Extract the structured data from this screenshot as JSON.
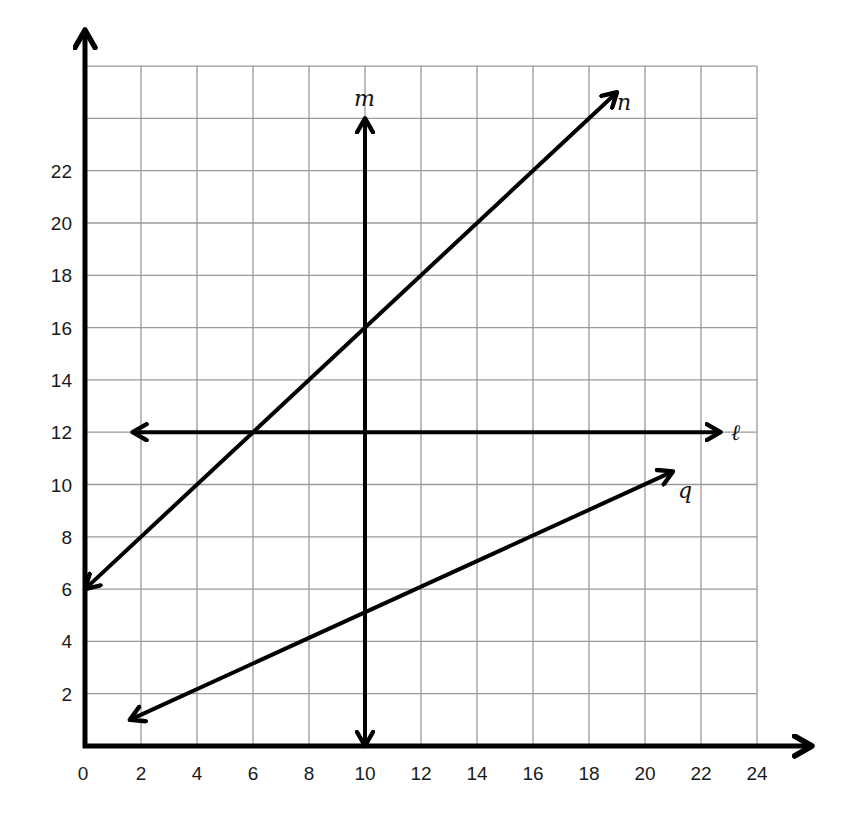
{
  "chart_data": {
    "type": "line",
    "title": "",
    "xlabel": "",
    "ylabel": "",
    "xlim": [
      0,
      24
    ],
    "ylim": [
      0,
      26
    ],
    "grid": true,
    "x_ticks": [
      "0",
      "2",
      "4",
      "6",
      "8",
      "10",
      "12",
      "14",
      "16",
      "18",
      "20",
      "22",
      "24"
    ],
    "y_ticks": [
      "2",
      "4",
      "6",
      "8",
      "10",
      "12",
      "14",
      "16",
      "18",
      "20",
      "22"
    ],
    "series": [
      {
        "name": "m",
        "type": "vertical line",
        "equation": "x = 10",
        "from": [
          10,
          0
        ],
        "to": [
          10,
          24
        ]
      },
      {
        "name": "n",
        "type": "line",
        "equation": "y = x + 6",
        "from": [
          0,
          6
        ],
        "to": [
          19,
          25
        ]
      },
      {
        "name": "ℓ",
        "type": "horizontal line",
        "equation": "y = 12",
        "from": [
          1.7,
          12
        ],
        "to": [
          22.7,
          12
        ]
      },
      {
        "name": "q",
        "type": "line",
        "equation": "y = 0.5x",
        "from": [
          1.6,
          1
        ],
        "to": [
          21,
          10.5
        ]
      }
    ]
  },
  "labels": {
    "m": "m",
    "n": "n",
    "l": "ℓ",
    "q": "q"
  },
  "colors": {
    "grid": "#9a9a9a",
    "axes": "#000000",
    "lines": "#000000"
  }
}
